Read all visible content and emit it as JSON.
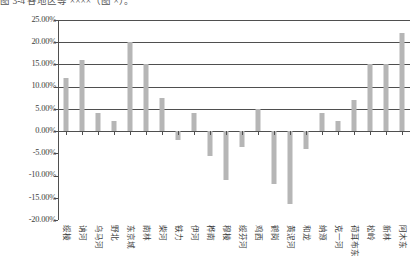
{
  "caption": "图 3-4  各地区等 ××××（图 ×）。",
  "chart_data": {
    "type": "bar",
    "title": "",
    "xlabel": "",
    "ylabel": "",
    "ylim": [
      -0.2,
      0.25
    ],
    "ytick_values": [
      0.25,
      0.2,
      0.15,
      0.1,
      0.05,
      0.0,
      -0.05,
      -0.1,
      -0.15,
      -0.2
    ],
    "ytick_labels": [
      "25.00%",
      "20.00%",
      "15.00%",
      "10.00%",
      "5.00%",
      "0.00%",
      "-5.00%",
      "-10.00%",
      "-15.00%",
      "-20.00%"
    ],
    "grid": true,
    "legend": false,
    "bar_color": "#b6b6b6",
    "axis_color": "#4f4f4f",
    "categories": [
      "绥棱",
      "讷河",
      "乌马河",
      "野北",
      "东京城",
      "南林",
      "柴河",
      "铁力",
      "伊河",
      "桦南",
      "穆棱",
      "绥芬河",
      "鸡西",
      "鹤岗",
      "黄泥河",
      "和龙",
      "纳源",
      "克一河",
      "荷耳布东",
      "松岭",
      "新林",
      "阿木东"
    ],
    "values": [
      0.12,
      0.16,
      0.04,
      0.023,
      0.2,
      0.15,
      0.075,
      -0.02,
      0.04,
      -0.055,
      -0.11,
      -0.035,
      0.05,
      -0.12,
      -0.165,
      -0.04,
      0.04,
      0.023,
      0.07,
      0.15,
      0.15,
      0.22
    ],
    "value_labels": [
      "12.00%",
      "16.00%",
      "4.00%",
      "2.30%",
      "20.00%",
      "15.00%",
      "7.50%",
      "-2.00%",
      "4.00%",
      "-5.50%",
      "-11.00%",
      "-3.50%",
      "5.00%",
      "-12.00%",
      "-16.50%",
      "-4.00%",
      "4.00%",
      "2.30%",
      "7.00%",
      "15.00%",
      "15.00%",
      "22.00%"
    ]
  }
}
